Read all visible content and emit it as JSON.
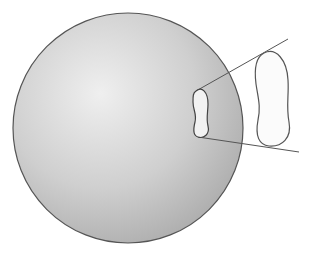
{
  "diagram": {
    "canvas": {
      "width": 311,
      "height": 253,
      "background": "#ffffff"
    },
    "sphere": {
      "cx": 128,
      "cy": 128,
      "r": 115,
      "fill_highlight": "#efefef",
      "fill_mid": "#cfcfcf",
      "fill_shadow": "#a8a8a8",
      "stroke": "#555555"
    },
    "small_patch": {
      "label": "patch on sphere surface",
      "fill": "#f2f2f2",
      "stroke": "#444444"
    },
    "large_patch": {
      "label": "projected patch",
      "fill": "#fbfbfb",
      "stroke": "#555555"
    },
    "cone_lines": {
      "stroke": "#555555",
      "upper": {
        "x1": 196,
        "y1": 91,
        "x2": 288,
        "y2": 39
      },
      "lower": {
        "x1": 198,
        "y1": 137,
        "x2": 299,
        "y2": 152
      }
    }
  }
}
